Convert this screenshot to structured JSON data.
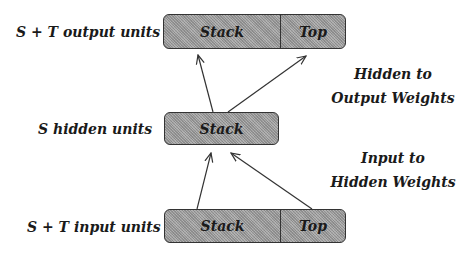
{
  "diagram": {
    "layers": {
      "output": {
        "label": "S + T output units",
        "cells": [
          "Stack",
          "Top"
        ]
      },
      "hidden": {
        "label": "S hidden units",
        "cells": [
          "Stack"
        ]
      },
      "input": {
        "label": "S + T input units",
        "cells": [
          "Stack",
          "Top"
        ]
      }
    },
    "weights": {
      "hidden_to_output": {
        "line1": "Hidden to",
        "line2": "Output Weights"
      },
      "input_to_hidden": {
        "line1": "Input to",
        "line2": "Hidden Weights"
      }
    },
    "colors": {
      "box_fill": "#a8a8a8",
      "stroke": "#333333",
      "text": "#1a1a1a"
    }
  }
}
